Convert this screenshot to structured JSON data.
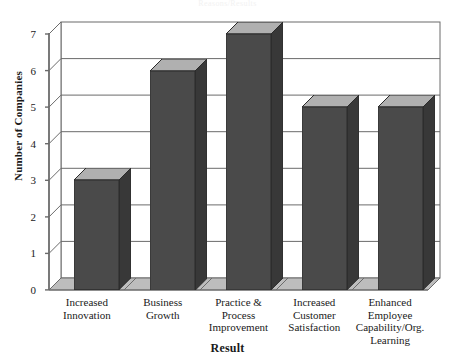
{
  "chart_data": {
    "type": "bar",
    "title": "Reasons/Results",
    "xlabel": "Result",
    "ylabel": "Number of Companies",
    "categories": [
      "Increased Innovation",
      "Business Growth",
      "Practice & Process Improvement",
      "Increased Customer Satisfaction",
      "Enhanced Employee Capability/Org. Learning"
    ],
    "category_lines": [
      [
        "Increased",
        "Innovation"
      ],
      [
        "Business",
        "Growth"
      ],
      [
        "Practice &",
        "Process",
        "Improvement"
      ],
      [
        "Increased",
        "Customer",
        "Satisfaction"
      ],
      [
        "Enhanced",
        "Employee",
        "Capability/Org.",
        "Learning"
      ]
    ],
    "values": [
      3,
      6,
      7,
      5,
      5
    ],
    "ylim": [
      0,
      7
    ],
    "yticks": [
      "0",
      "1",
      "2",
      "3",
      "4",
      "5",
      "6",
      "7"
    ],
    "grid": true,
    "legend": false,
    "style": "3d-bar",
    "colors": {
      "bar_front": "#4a4a4a",
      "bar_side": "#383838",
      "bar_top": "#b0b0b0",
      "floor": "#bdbdbd",
      "wall": "#ffffff",
      "axis": "#6b6b6b",
      "text": "#1a1a1a"
    }
  }
}
